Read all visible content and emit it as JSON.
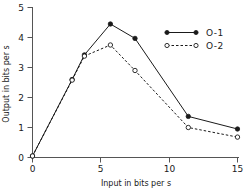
{
  "chart_data": {
    "type": "line",
    "title": "",
    "xlabel": "Input in bits per s",
    "ylabel": "Output in bits per s",
    "xlim": [
      0,
      15.6
    ],
    "ylim": [
      0,
      5.2
    ],
    "xticks": [
      0,
      5,
      10,
      15
    ],
    "xtick_labels": [
      "0",
      "5",
      "10",
      "15"
    ],
    "yticks": [
      0,
      1,
      2,
      3,
      4,
      5
    ],
    "ytick_labels": [
      "0",
      "1",
      "2",
      "3",
      "4",
      "5"
    ],
    "grid": false,
    "legend_position": "upper right",
    "series": [
      {
        "name": "O-1",
        "marker": "filled-circle",
        "linestyle": "solid",
        "color": "#1a1a1a",
        "x": [
          0.0,
          2.9,
          3.8,
          5.7,
          7.5,
          11.4,
          15.0
        ],
        "y": [
          0.05,
          2.6,
          3.42,
          4.45,
          3.97,
          1.37,
          0.95
        ]
      },
      {
        "name": "O-2",
        "marker": "open-circle",
        "linestyle": "dashed",
        "color": "#1a1a1a",
        "x": [
          0.0,
          2.9,
          3.8,
          5.7,
          7.5,
          11.4,
          15.0
        ],
        "y": [
          0.05,
          2.58,
          3.38,
          3.75,
          2.9,
          1.0,
          0.68
        ]
      }
    ]
  },
  "legend": {
    "entries": [
      {
        "label": "O-1"
      },
      {
        "label": "O-2"
      }
    ]
  },
  "axes": {
    "x_title": "Input in bits per s",
    "y_title": "Output in bits per s",
    "x_tick_labels": [
      "0",
      "5",
      "10",
      "15"
    ],
    "y_tick_labels": [
      "0",
      "1",
      "2",
      "3",
      "4",
      "5"
    ]
  }
}
